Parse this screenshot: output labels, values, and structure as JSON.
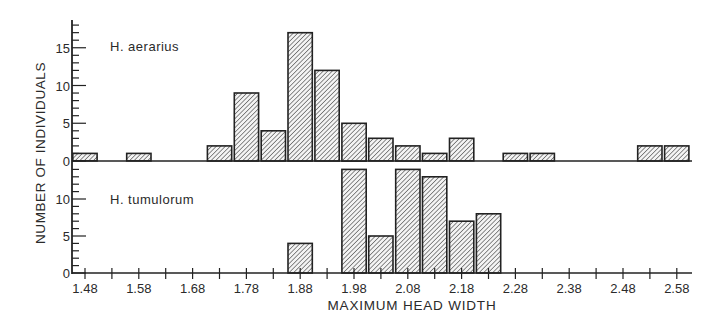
{
  "chart_data": {
    "type": "bar",
    "title": "",
    "xlabel": "MAXIMUM HEAD WIDTH",
    "ylabel": "NUMBER OF INDIVIDUALS",
    "x_ticks": [
      "1.48",
      "1.58",
      "1.68",
      "1.78",
      "1.88",
      "1.98",
      "2.08",
      "2.18",
      "2.28",
      "2.38",
      "2.48",
      "2.58"
    ],
    "xlim": [
      1.455,
      2.605
    ],
    "bin_width": 0.05,
    "grid": false,
    "legend": "none",
    "panels": [
      {
        "name": "H. aerarius",
        "y_ticks": [
          "0",
          "5",
          "10",
          "15"
        ],
        "ylim": [
          0,
          18
        ],
        "x": [
          1.48,
          1.58,
          1.73,
          1.78,
          1.83,
          1.88,
          1.93,
          1.98,
          2.03,
          2.08,
          2.13,
          2.18,
          2.28,
          2.33,
          2.53,
          2.58
        ],
        "values": [
          1,
          1,
          2,
          9,
          4,
          17,
          12,
          5,
          3,
          2,
          1,
          3,
          1,
          1,
          2,
          2
        ]
      },
      {
        "name": "H. tumulorum",
        "y_ticks": [
          "0",
          "5",
          "10"
        ],
        "ylim": [
          0,
          15
        ],
        "x": [
          1.88,
          1.98,
          2.03,
          2.08,
          2.13,
          2.18,
          2.23
        ],
        "values": [
          4,
          14,
          5,
          14,
          13,
          7,
          8
        ]
      }
    ]
  }
}
